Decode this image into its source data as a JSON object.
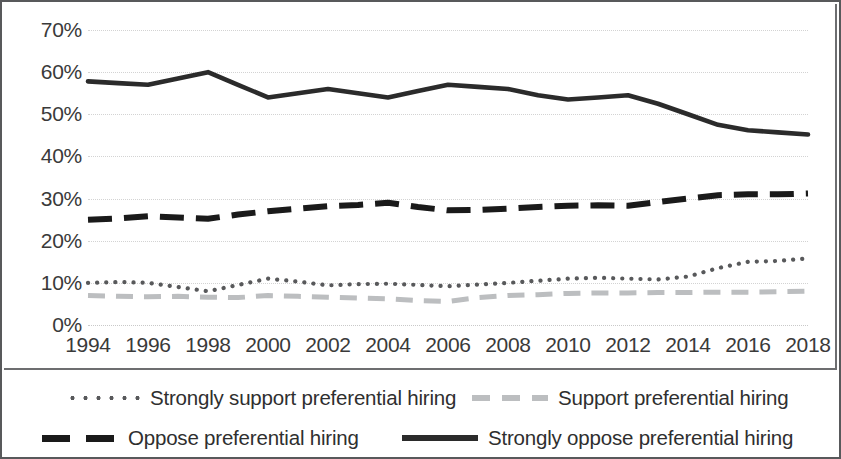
{
  "chart_data": {
    "type": "line",
    "title": "",
    "xlabel": "",
    "ylabel": "",
    "x": [
      1994,
      1995,
      1996,
      1997,
      1998,
      1999,
      2000,
      2001,
      2002,
      2003,
      2004,
      2005,
      2006,
      2007,
      2008,
      2009,
      2010,
      2011,
      2012,
      2013,
      2014,
      2015,
      2016,
      2017,
      2018
    ],
    "xlim": [
      1994,
      2018
    ],
    "ylim": [
      0,
      70
    ],
    "yticks": [
      0,
      10,
      20,
      30,
      40,
      50,
      60,
      70
    ],
    "ytick_labels": [
      "0%",
      "10%",
      "20%",
      "30%",
      "40%",
      "50%",
      "60%",
      "70%"
    ],
    "xticks": [
      1994,
      1996,
      1998,
      2000,
      2002,
      2004,
      2006,
      2008,
      2010,
      2012,
      2014,
      2016,
      2018
    ],
    "xtick_labels": [
      "1994",
      "1996",
      "1998",
      "2000",
      "2002",
      "2004",
      "2006",
      "2008",
      "2010",
      "2012",
      "2014",
      "2016",
      "2018"
    ],
    "grid": true,
    "grid_style": "dotted-horizontal",
    "legend_position": "bottom",
    "series": [
      {
        "name": "Strongly support preferential hiring",
        "style": "dotted",
        "color": "#58595b",
        "values": [
          10.0,
          10.2,
          10.0,
          9.0,
          8.0,
          9.5,
          11.0,
          10.3,
          9.4,
          9.7,
          9.8,
          9.5,
          9.2,
          9.6,
          10.0,
          10.5,
          11.0,
          11.2,
          11.0,
          10.8,
          11.5,
          13.5,
          15.0,
          15.2,
          15.8
        ]
      },
      {
        "name": "Support preferential hiring",
        "style": "dashed-light",
        "color": "#bcbec0",
        "values": [
          7.0,
          6.8,
          6.7,
          6.8,
          6.6,
          6.5,
          7.0,
          6.8,
          6.6,
          6.4,
          6.2,
          5.8,
          5.6,
          6.5,
          7.0,
          7.2,
          7.5,
          7.6,
          7.6,
          7.7,
          7.7,
          7.8,
          7.8,
          7.9,
          8.0
        ]
      },
      {
        "name": "Oppose preferential hiring",
        "style": "dashed-dark",
        "color": "#1a1a1a",
        "values": [
          25.0,
          25.3,
          25.8,
          25.5,
          25.2,
          26.2,
          27.0,
          27.6,
          28.2,
          28.5,
          29.0,
          28.0,
          27.2,
          27.3,
          27.6,
          28.0,
          28.3,
          28.4,
          28.3,
          29.2,
          30.0,
          30.8,
          31.0,
          31.0,
          31.2
        ]
      },
      {
        "name": "Strongly oppose preferential hiring",
        "style": "solid",
        "color": "#2b2b2b",
        "values": [
          57.8,
          57.4,
          57.0,
          58.5,
          60.0,
          57.0,
          54.0,
          55.0,
          56.0,
          55.0,
          54.0,
          55.5,
          57.0,
          56.5,
          56.0,
          54.5,
          53.5,
          54.0,
          54.5,
          52.5,
          50.0,
          47.5,
          46.2,
          45.7,
          45.2
        ]
      }
    ]
  },
  "legend": {
    "entries": [
      {
        "label": "Strongly support preferential hiring",
        "swatch": "dotted-line-swatch"
      },
      {
        "label": "Support preferential hiring",
        "swatch": "light-dashed-line-swatch"
      },
      {
        "label": "Oppose preferential hiring",
        "swatch": "dark-dashed-line-swatch"
      },
      {
        "label": "Strongly oppose preferential hiring",
        "swatch": "solid-line-swatch"
      }
    ]
  }
}
